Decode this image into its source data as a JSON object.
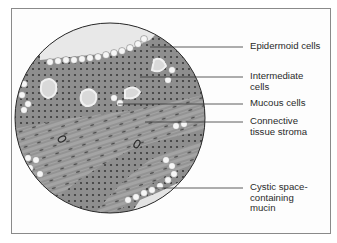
{
  "figure": {
    "type": "histology-illustration",
    "labels": [
      {
        "id": "epidermoid",
        "text": "Epidermoid cells",
        "y": 47
      },
      {
        "id": "intermediate",
        "text": "Intermediate\ncells",
        "y": 77
      },
      {
        "id": "mucous",
        "text": "Mucous cells",
        "y": 104
      },
      {
        "id": "connective",
        "text": "Connective\ntissue stroma",
        "y": 122
      },
      {
        "id": "cystic",
        "text": "Cystic space-\ncontaining\nmucin",
        "y": 188
      }
    ],
    "colors": {
      "frame": "#8a8a8a",
      "leader": "#333333",
      "tissue_dark": "#6e6e6e",
      "tissue_mid": "#9a9a9a",
      "cell_light": "#f4f4f4",
      "cyst_fill": "#d9d9d9"
    }
  }
}
